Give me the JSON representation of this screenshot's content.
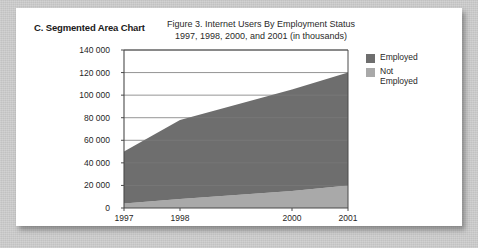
{
  "panel": {
    "heading": "C. Segmented Area Chart"
  },
  "figure": {
    "title_line1": "Figure 3. Internet Users By Employment Status",
    "title_line2": "1997, 1998, 2000, and 2001 (in thousands)"
  },
  "legend": {
    "position": "right",
    "items": [
      {
        "label": "Employed",
        "color": "#6e6e6e"
      },
      {
        "label": "Not\nEmployed",
        "color": "#a9a9a9"
      }
    ]
  },
  "chart_data": {
    "type": "area",
    "stacked": true,
    "title": "Figure 3. Internet Users By Employment Status 1997, 1998, 2000, and 2001 (in thousands)",
    "xlabel": "",
    "ylabel": "",
    "x": [
      1997,
      1998,
      2000,
      2001
    ],
    "categories": [
      "1997",
      "1998",
      "2000",
      "2001"
    ],
    "xtick_labels": [
      "1997",
      "1998",
      "2000",
      "2001"
    ],
    "ytick_labels": [
      "0",
      "20 000",
      "40 000",
      "60 000",
      "80 000",
      "100 000",
      "120 000",
      "140 000"
    ],
    "ytick_values": [
      0,
      20000,
      40000,
      60000,
      80000,
      100000,
      120000,
      140000
    ],
    "ylim": [
      0,
      140000
    ],
    "xlim": [
      1997,
      2001
    ],
    "grid": true,
    "grid_axis": "y",
    "series": [
      {
        "name": "Not Employed",
        "color": "#a9a9a9",
        "values": [
          4000,
          8000,
          15000,
          20000
        ]
      },
      {
        "name": "Employed",
        "color": "#6e6e6e",
        "values": [
          46000,
          70000,
          90000,
          100000
        ]
      }
    ],
    "totals": [
      50000,
      78000,
      105000,
      120000
    ]
  },
  "colors": {
    "card_background": "#ffffff",
    "page_background": "#c9c9c9",
    "axis": "#4a4a4a",
    "grid": "#7a7a7a",
    "text": "#1f1f1f"
  }
}
